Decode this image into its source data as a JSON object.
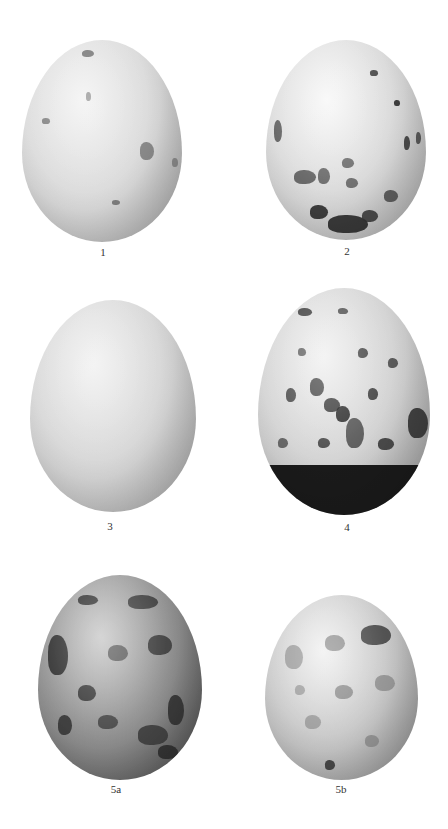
{
  "plate": {
    "background": "#ffffff",
    "eggs": [
      {
        "id": "egg-1",
        "label": "1",
        "box": [
          22,
          40,
          160,
          202
        ],
        "base": "#d8d8d8",
        "light": "#f2f2f2",
        "dark": "#9a9a9a",
        "pattern": "sparse-faint",
        "spots": [
          [
            60,
            10,
            12,
            7,
            "#6a6a6a"
          ],
          [
            118,
            102,
            14,
            18,
            "#7a7a7a"
          ],
          [
            20,
            78,
            8,
            6,
            "#777777"
          ],
          [
            90,
            160,
            8,
            5,
            "#6e6e6e"
          ],
          [
            140,
            20,
            8,
            6,
            "#777777"
          ],
          [
            64,
            52,
            5,
            9,
            "#888888"
          ],
          [
            150,
            118,
            6,
            9,
            "#808080"
          ]
        ]
      },
      {
        "id": "egg-2",
        "label": "2",
        "box": [
          266,
          40,
          160,
          200
        ],
        "base": "#d6d6d6",
        "light": "#f7f7f7",
        "dark": "#9c9c9c",
        "pattern": "speckled-base-cap",
        "spots": [
          [
            28,
            130,
            22,
            14,
            "#555555"
          ],
          [
            52,
            128,
            12,
            16,
            "#5a5a5a"
          ],
          [
            76,
            118,
            12,
            10,
            "#5e5e5e"
          ],
          [
            80,
            138,
            12,
            10,
            "#5e5e5e"
          ],
          [
            44,
            165,
            18,
            14,
            "#222222"
          ],
          [
            62,
            175,
            40,
            18,
            "#1e1e1e"
          ],
          [
            96,
            170,
            16,
            12,
            "#333333"
          ],
          [
            118,
            150,
            14,
            12,
            "#4a4a4a"
          ],
          [
            138,
            96,
            6,
            14,
            "#333333"
          ],
          [
            104,
            30,
            8,
            6,
            "#333333"
          ],
          [
            128,
            60,
            6,
            6,
            "#222222"
          ],
          [
            8,
            80,
            8,
            22,
            "#555555"
          ],
          [
            150,
            92,
            5,
            12,
            "#444444"
          ]
        ]
      },
      {
        "id": "egg-3",
        "label": "3",
        "box": [
          30,
          300,
          166,
          212
        ],
        "base": "#d4d4d4",
        "light": "#f0f0f0",
        "dark": "#9a9a9a",
        "pattern": "fine-speckle",
        "spots": []
      },
      {
        "id": "egg-4",
        "label": "4",
        "box": [
          258,
          288,
          172,
          227
        ],
        "base": "#cfcfcf",
        "light": "#f0f0f0",
        "dark": "#8a8a8a",
        "pattern": "heavy-blotch-dark-cap",
        "spots": [
          [
            52,
            90,
            14,
            18,
            "#3a3a3a"
          ],
          [
            66,
            110,
            16,
            14,
            "#2e2e2e"
          ],
          [
            78,
            118,
            14,
            16,
            "#1e1e1e"
          ],
          [
            88,
            130,
            18,
            30,
            "#4a4a4a"
          ],
          [
            28,
            100,
            10,
            14,
            "#3e3e3e"
          ],
          [
            110,
            100,
            10,
            12,
            "#333333"
          ],
          [
            130,
            70,
            10,
            10,
            "#444444"
          ],
          [
            150,
            120,
            20,
            30,
            "#2a2a2a"
          ],
          [
            40,
            60,
            8,
            8,
            "#555555"
          ],
          [
            100,
            60,
            10,
            10,
            "#3a3a3a"
          ],
          [
            60,
            150,
            12,
            10,
            "#3a3a3a"
          ],
          [
            120,
            150,
            16,
            12,
            "#333333"
          ],
          [
            20,
            150,
            10,
            10,
            "#555555"
          ],
          [
            80,
            20,
            10,
            6,
            "#444444"
          ],
          [
            40,
            20,
            14,
            8,
            "#333333"
          ]
        ]
      },
      {
        "id": "egg-5a",
        "label": "5a",
        "box": [
          38,
          575,
          164,
          205
        ],
        "base": "#8c8c8c",
        "light": "#c8c8c8",
        "dark": "#3a3a3a",
        "pattern": "dense-dark-mottled",
        "spots": [
          [
            10,
            60,
            20,
            40,
            "#2a2a2a"
          ],
          [
            40,
            110,
            18,
            16,
            "#333333"
          ],
          [
            70,
            70,
            20,
            16,
            "#555555"
          ],
          [
            110,
            60,
            24,
            20,
            "#3a3a3a"
          ],
          [
            130,
            120,
            16,
            30,
            "#2e2e2e"
          ],
          [
            60,
            140,
            20,
            14,
            "#444444"
          ],
          [
            20,
            140,
            14,
            20,
            "#333333"
          ],
          [
            90,
            20,
            30,
            14,
            "#3a3a3a"
          ],
          [
            40,
            20,
            20,
            10,
            "#2e2e2e"
          ],
          [
            100,
            150,
            30,
            20,
            "#3a3a3a"
          ],
          [
            120,
            170,
            20,
            14,
            "#2a2a2a"
          ]
        ]
      },
      {
        "id": "egg-5b",
        "label": "5b",
        "box": [
          265,
          595,
          153,
          185
        ],
        "base": "#c4c4c4",
        "light": "#f0f0f0",
        "dark": "#808080",
        "pattern": "light-mottled",
        "spots": [
          [
            96,
            30,
            30,
            20,
            "#3e3e3e"
          ],
          [
            60,
            40,
            20,
            16,
            "#8a8a8a"
          ],
          [
            20,
            50,
            18,
            24,
            "#9a9a9a"
          ],
          [
            110,
            80,
            20,
            16,
            "#8e8e8e"
          ],
          [
            70,
            90,
            18,
            14,
            "#8a8a8a"
          ],
          [
            40,
            120,
            16,
            14,
            "#999999"
          ],
          [
            60,
            165,
            10,
            10,
            "#333333"
          ],
          [
            100,
            140,
            14,
            12,
            "#8c8c8c"
          ],
          [
            30,
            90,
            10,
            10,
            "#9c9c9c"
          ]
        ]
      }
    ]
  }
}
